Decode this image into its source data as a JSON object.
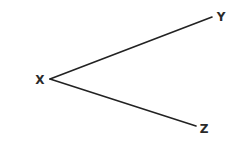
{
  "diagram": {
    "type": "angle",
    "stroke_color": "#222222",
    "label_color": "#2a2a2a",
    "vertex": {
      "label": "X",
      "x": 50,
      "y": 79,
      "label_x": 40,
      "label_y": 84
    },
    "rays": [
      {
        "label": "Y",
        "end_x": 212,
        "end_y": 17,
        "label_x": 221,
        "label_y": 21
      },
      {
        "label": "Z",
        "end_x": 196,
        "end_y": 126,
        "label_x": 204,
        "label_y": 133
      }
    ]
  }
}
